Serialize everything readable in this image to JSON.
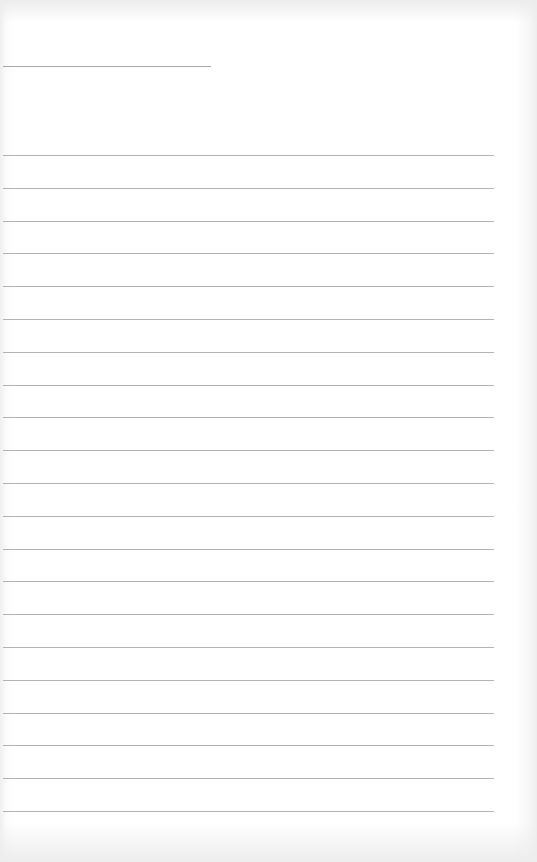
{
  "page": {
    "type": "lined-paper",
    "header_line": {
      "visible": true
    },
    "ruled_line_count": 21,
    "colors": {
      "paper": "#ffffff",
      "rule": "#b3b3b3",
      "header_rule": "#a9a9a9"
    }
  }
}
